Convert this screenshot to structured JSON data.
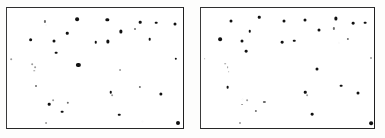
{
  "figure": {
    "type": "two-panel-point-pattern",
    "panel_count": 2,
    "background_color": "#fdfdfc",
    "frame_color": "#242424",
    "point_color": "#111111"
  },
  "chart_data": [
    {
      "type": "scatter",
      "title": "",
      "subtitle": "",
      "xlabel": "",
      "ylabel": "",
      "xlim": [
        0,
        100
      ],
      "ylim": [
        0,
        100
      ],
      "grid": false,
      "legend": null,
      "ticks": {
        "x": [],
        "y": []
      },
      "panel_label": "left",
      "n_points": 41,
      "series": [
        {
          "name": "points",
          "points": [
            {
              "x": 21.2,
              "y": 89.5,
              "size": 1.7,
              "shade": "faint"
            },
            {
              "x": 39.7,
              "y": 91.5,
              "size": 3.0,
              "shade": "dark"
            },
            {
              "x": 57.0,
              "y": 91.0,
              "size": 2.7,
              "shade": "dark"
            },
            {
              "x": 76.0,
              "y": 89.0,
              "size": 2.1,
              "shade": "dark"
            },
            {
              "x": 85.0,
              "y": 88.5,
              "size": 2.1,
              "shade": "dark"
            },
            {
              "x": 96.0,
              "y": 87.5,
              "size": 2.4,
              "shade": "dark"
            },
            {
              "x": 34.0,
              "y": 79.5,
              "size": 2.0,
              "shade": "dark"
            },
            {
              "x": 65.0,
              "y": 81.0,
              "size": 2.6,
              "shade": "dark"
            },
            {
              "x": 73.0,
              "y": 83.0,
              "size": 1.6,
              "shade": "faint"
            },
            {
              "x": 13.0,
              "y": 74.0,
              "size": 3.0,
              "shade": "dark"
            },
            {
              "x": 26.5,
              "y": 72.5,
              "size": 2.4,
              "shade": "dark"
            },
            {
              "x": 50.5,
              "y": 72.0,
              "size": 2.0,
              "shade": "dark"
            },
            {
              "x": 57.5,
              "y": 72.5,
              "size": 2.6,
              "shade": "dark"
            },
            {
              "x": 81.5,
              "y": 74.5,
              "size": 2.1,
              "shade": "dark"
            },
            {
              "x": 27.5,
              "y": 63.0,
              "size": 2.2,
              "shade": "dark"
            },
            {
              "x": 2.0,
              "y": 57.5,
              "size": 1.3,
              "shade": "vfaint"
            },
            {
              "x": 96.5,
              "y": 58.0,
              "size": 1.9,
              "shade": "dark"
            },
            {
              "x": 14.0,
              "y": 53.0,
              "size": 1.3,
              "shade": "vfaint"
            },
            {
              "x": 15.5,
              "y": 51.0,
              "size": 1.4,
              "shade": "vfaint"
            },
            {
              "x": 40.5,
              "y": 52.5,
              "size": 3.4,
              "shade": "dark"
            },
            {
              "x": 15.0,
              "y": 47.5,
              "size": 1.2,
              "shade": "vfaint"
            },
            {
              "x": 64.5,
              "y": 48.0,
              "size": 1.5,
              "shade": "vfaint"
            },
            {
              "x": 16.0,
              "y": 34.5,
              "size": 1.6,
              "shade": "faint"
            },
            {
              "x": 76.0,
              "y": 34.0,
              "size": 1.8,
              "shade": "faint"
            },
            {
              "x": 59.0,
              "y": 29.5,
              "size": 2.0,
              "shade": "dark"
            },
            {
              "x": 60.0,
              "y": 27.0,
              "size": 1.4,
              "shade": "vfaint"
            },
            {
              "x": 88.0,
              "y": 28.0,
              "size": 2.6,
              "shade": "dark"
            },
            {
              "x": 26.0,
              "y": 23.0,
              "size": 1.4,
              "shade": "vfaint"
            },
            {
              "x": 23.5,
              "y": 19.5,
              "size": 2.1,
              "shade": "dark"
            },
            {
              "x": 34.5,
              "y": 20.5,
              "size": 1.9,
              "shade": "faint"
            },
            {
              "x": 31.0,
              "y": 13.0,
              "size": 2.2,
              "shade": "dark"
            },
            {
              "x": 64.0,
              "y": 10.5,
              "size": 2.0,
              "shade": "dark"
            },
            {
              "x": 22.0,
              "y": 3.0,
              "size": 1.5,
              "shade": "vfaint"
            },
            {
              "x": 97.5,
              "y": 3.5,
              "size": 3.2,
              "shade": "dark"
            }
          ]
        }
      ]
    },
    {
      "type": "scatter",
      "title": "",
      "subtitle": "",
      "xlabel": "",
      "ylabel": "",
      "xlim": [
        0,
        100
      ],
      "ylim": [
        0,
        100
      ],
      "grid": false,
      "legend": null,
      "ticks": {
        "x": [],
        "y": []
      },
      "panel_label": "right",
      "n_points": 41,
      "series": [
        {
          "name": "points",
          "points": [
            {
              "x": 17.0,
              "y": 90.0,
              "size": 2.4,
              "shade": "dark"
            },
            {
              "x": 33.5,
              "y": 93.0,
              "size": 2.0,
              "shade": "dark"
            },
            {
              "x": 48.0,
              "y": 90.0,
              "size": 2.4,
              "shade": "dark"
            },
            {
              "x": 60.5,
              "y": 91.0,
              "size": 2.4,
              "shade": "dark"
            },
            {
              "x": 78.5,
              "y": 92.0,
              "size": 2.6,
              "shade": "dark"
            },
            {
              "x": 88.5,
              "y": 88.0,
              "size": 2.2,
              "shade": "dark"
            },
            {
              "x": 95.5,
              "y": 88.5,
              "size": 2.2,
              "shade": "dark"
            },
            {
              "x": 104.0,
              "y": 87.0,
              "size": 2.2,
              "shade": "dark"
            },
            {
              "x": 28.0,
              "y": 81.0,
              "size": 2.0,
              "shade": "dark"
            },
            {
              "x": 68.5,
              "y": 82.0,
              "size": 2.4,
              "shade": "dark"
            },
            {
              "x": 77.0,
              "y": 83.5,
              "size": 1.8,
              "shade": "faint"
            },
            {
              "x": 10.5,
              "y": 74.5,
              "size": 3.0,
              "shade": "dark"
            },
            {
              "x": 23.5,
              "y": 73.0,
              "size": 2.4,
              "shade": "dark"
            },
            {
              "x": 47.0,
              "y": 72.0,
              "size": 2.2,
              "shade": "dark"
            },
            {
              "x": 54.0,
              "y": 73.0,
              "size": 2.0,
              "shade": "dark"
            },
            {
              "x": 85.5,
              "y": 74.5,
              "size": 1.8,
              "shade": "faint"
            },
            {
              "x": 26.0,
              "y": 64.0,
              "size": 2.2,
              "shade": "dark"
            },
            {
              "x": 1.5,
              "y": 58.0,
              "size": 1.3,
              "shade": "vfaint"
            },
            {
              "x": 99.0,
              "y": 58.5,
              "size": 1.6,
              "shade": "vfaint"
            },
            {
              "x": 13.5,
              "y": 53.5,
              "size": 1.3,
              "shade": "vfaint"
            },
            {
              "x": 15.0,
              "y": 51.0,
              "size": 1.4,
              "shade": "vfaint"
            },
            {
              "x": 15.5,
              "y": 47.0,
              "size": 1.3,
              "shade": "vfaint"
            },
            {
              "x": 67.0,
              "y": 49.5,
              "size": 2.4,
              "shade": "dark"
            },
            {
              "x": 15.0,
              "y": 34.0,
              "size": 2.2,
              "shade": "dark"
            },
            {
              "x": 81.5,
              "y": 35.0,
              "size": 2.2,
              "shade": "dark"
            },
            {
              "x": 60.5,
              "y": 29.5,
              "size": 2.0,
              "shade": "dark"
            },
            {
              "x": 61.5,
              "y": 27.0,
              "size": 1.4,
              "shade": "vfaint"
            },
            {
              "x": 91.5,
              "y": 28.5,
              "size": 2.4,
              "shade": "dark"
            },
            {
              "x": 26.5,
              "y": 23.0,
              "size": 1.4,
              "shade": "vfaint"
            },
            {
              "x": 23.5,
              "y": 19.0,
              "size": 1.5,
              "shade": "vfaint"
            },
            {
              "x": 36.5,
              "y": 21.0,
              "size": 1.8,
              "shade": "faint"
            },
            {
              "x": 31.5,
              "y": 13.5,
              "size": 1.8,
              "shade": "faint"
            },
            {
              "x": 64.5,
              "y": 11.0,
              "size": 2.2,
              "shade": "dark"
            },
            {
              "x": 22.5,
              "y": 3.5,
              "size": 1.6,
              "shade": "vfaint"
            },
            {
              "x": 99.0,
              "y": 3.5,
              "size": 3.0,
              "shade": "dark"
            }
          ]
        }
      ]
    }
  ],
  "panels": {
    "left": {
      "name": "left-panel",
      "left": 6,
      "top": 7,
      "width": 178,
      "height": 122
    },
    "right": {
      "name": "right-panel",
      "left": 200,
      "top": 7,
      "width": 175,
      "height": 122
    }
  }
}
